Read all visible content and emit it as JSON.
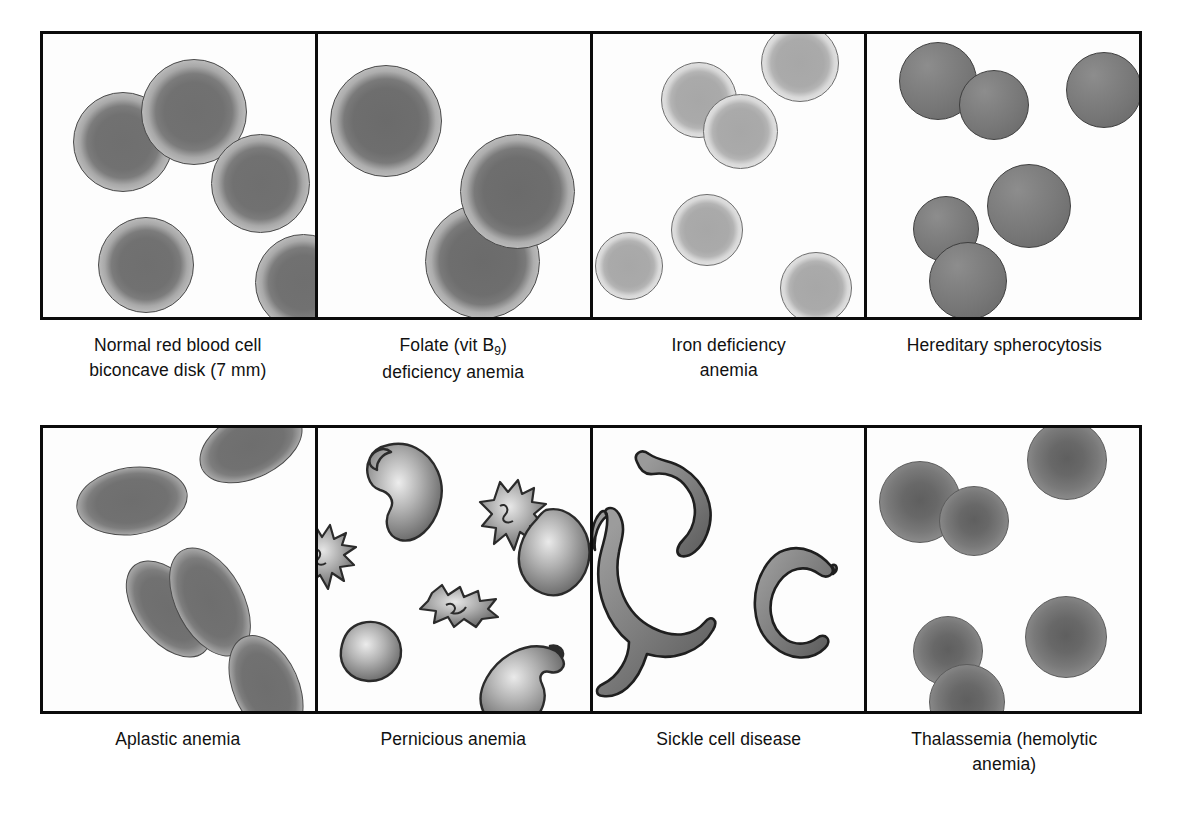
{
  "figure": {
    "rows": [
      {
        "id": "top",
        "panels": [
          {
            "name": "normal-red-blood-cell",
            "caption_line1": "Normal red blood cell",
            "caption_line2": "biconcave disk (7 mm)",
            "cell_type": "biconcave-disk",
            "cell_count": 5,
            "description": "Round cells with pale central area (central pallor)"
          },
          {
            "name": "folate-deficiency-anemia",
            "caption_line1": "Folate (vit B",
            "caption_sub": "9",
            "caption_line1_end": ")",
            "caption_line2": "deficiency anemia",
            "cell_type": "macrocyte",
            "cell_count": 3,
            "description": "Enlarged round cells (macrocytes)"
          },
          {
            "name": "iron-deficiency-anemia",
            "caption_line1": "Iron deficiency",
            "caption_line2": "anemia",
            "cell_type": "hypochromic-microcyte",
            "cell_count": 6,
            "description": "Pale cells with enlarged central pallor (hypochromic)"
          },
          {
            "name": "hereditary-spherocytosis",
            "caption_line1": "Hereditary spherocytosis",
            "caption_line2": "",
            "cell_type": "spherocyte",
            "cell_count": 6,
            "description": "Dense round spheres without central pallor"
          }
        ]
      },
      {
        "id": "bottom",
        "panels": [
          {
            "name": "aplastic-anemia",
            "caption_line1": "Aplastic anemia",
            "caption_line2": "",
            "cell_type": "ovalocyte",
            "cell_count": 5,
            "description": "Oval-shaped cells at varied orientations"
          },
          {
            "name": "pernicious-anemia",
            "caption_line1": "Pernicious anemia",
            "caption_line2": "",
            "cell_type": "poikilocyte",
            "cell_count": 7,
            "description": "Irregular, teardrop and spiculated cells (poikilocytosis)"
          },
          {
            "name": "sickle-cell-disease",
            "caption_line1": "Sickle cell disease",
            "caption_line2": "",
            "cell_type": "sickle-cell",
            "cell_count": 3,
            "description": "Elongated crescent cells with pointed ends"
          },
          {
            "name": "thalassemia-hemolytic-anemia",
            "caption_line1": "Thalassemia (hemolytic",
            "caption_line2": "anemia)",
            "cell_type": "microcyte",
            "cell_count": 6,
            "description": "Small cells with dark centre"
          }
        ]
      }
    ],
    "colors": {
      "border": "#0b0b0b",
      "background": "#ffffff",
      "cell_dark": "#6f6f6f",
      "cell_pale": "#b9b9b9",
      "cell_hypochromic": "#d8d8d8",
      "caption_text": "#111111"
    }
  }
}
